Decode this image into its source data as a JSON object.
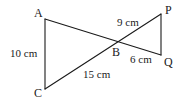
{
  "diagram": {
    "type": "geometry",
    "points": {
      "A": {
        "label": "A",
        "x": 45,
        "y": 19
      },
      "B": {
        "label": "B",
        "x": 117,
        "y": 42
      },
      "C": {
        "label": "C",
        "x": 45,
        "y": 89
      },
      "P": {
        "label": "P",
        "x": 161,
        "y": 14
      },
      "Q": {
        "label": "Q",
        "x": 161,
        "y": 55
      }
    },
    "segments": [
      {
        "from": "A",
        "to": "Q"
      },
      {
        "from": "C",
        "to": "P"
      },
      {
        "from": "A",
        "to": "C"
      },
      {
        "from": "P",
        "to": "Q"
      }
    ],
    "measurements": {
      "AC": "10 cm",
      "BP": "9 cm",
      "BQ": "6 cm",
      "BC": "15 cm"
    },
    "colors": {
      "stroke": "#1a1a1a",
      "background": "#ffffff"
    }
  }
}
